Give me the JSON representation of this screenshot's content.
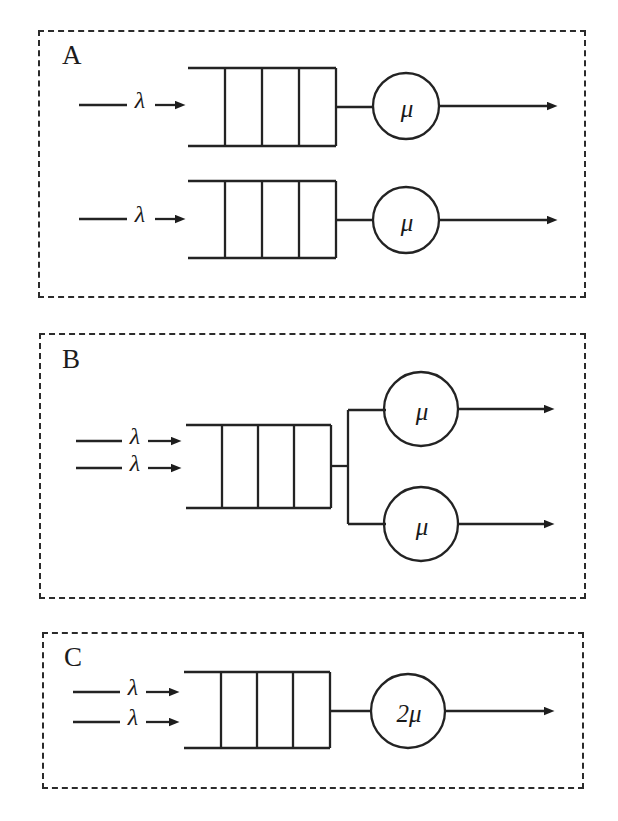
{
  "figure": {
    "type": "queueing-system-diagram",
    "stroke_color": "#222222",
    "background_color": "#ffffff",
    "panel_border_style": "dashed"
  },
  "panels": [
    {
      "id": "A",
      "label": "A",
      "config": "two independent single-server queues",
      "rows": [
        {
          "arrival_label": "λ",
          "queue_cells": 4,
          "server_label": "μ",
          "departure_arrow": true
        },
        {
          "arrival_label": "λ",
          "queue_cells": 4,
          "server_label": "μ",
          "departure_arrow": true
        }
      ]
    },
    {
      "id": "B",
      "label": "B",
      "config": "single shared queue feeding two parallel servers",
      "arrivals": [
        "λ",
        "λ"
      ],
      "queue_cells": 4,
      "servers": [
        "μ",
        "μ"
      ],
      "departure_arrows": 2
    },
    {
      "id": "C",
      "label": "C",
      "config": "single queue with one server of doubled rate",
      "arrivals": [
        "λ",
        "λ"
      ],
      "queue_cells": 4,
      "servers": [
        "2μ"
      ],
      "server_coefficient": "2",
      "server_symbol": "μ",
      "departure_arrows": 1
    }
  ],
  "symbols": {
    "arrival_rate": "λ",
    "service_rate": "μ",
    "doubled_service_rate": "2μ"
  }
}
